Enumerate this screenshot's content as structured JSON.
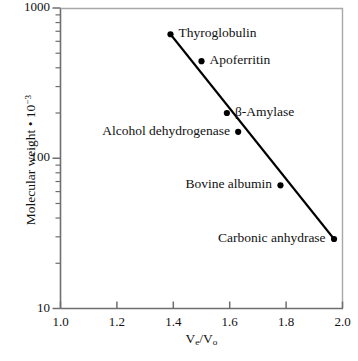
{
  "chart_data": {
    "type": "scatter",
    "title": "",
    "xlabel": "Ve/Vo",
    "ylabel": "Molecular weight • 10−3",
    "xlim": [
      1.0,
      2.0
    ],
    "ylim": [
      10,
      1000
    ],
    "yscale": "log",
    "xscale": "linear",
    "grid": false,
    "legend": "none",
    "xticks": [
      "1.0",
      "1.2",
      "1.4",
      "1.6",
      "1.8",
      "2.0"
    ],
    "xtick_values": [
      1.0,
      1.2,
      1.4,
      1.6,
      1.8,
      2.0
    ],
    "yticks": [
      "10",
      "100",
      "1000"
    ],
    "ytick_values": [
      10,
      100,
      1000
    ],
    "yminor_values": [
      20,
      30,
      40,
      50,
      60,
      70,
      80,
      90,
      200,
      300,
      400,
      500,
      600,
      700,
      800,
      900
    ],
    "series": [
      {
        "name": "proteins",
        "marker": "filled-circle",
        "points": [
          {
            "label": "Thyroglobulin",
            "x": 1.39,
            "y": 669,
            "label_pos": "right"
          },
          {
            "label": "Apoferritin",
            "x": 1.5,
            "y": 443,
            "label_pos": "right"
          },
          {
            "label": "β-Amylase",
            "x": 1.59,
            "y": 200,
            "label_pos": "right"
          },
          {
            "label": "Alcohol dehydrogenase",
            "x": 1.63,
            "y": 150,
            "label_pos": "left"
          },
          {
            "label": "Bovine albumin",
            "x": 1.78,
            "y": 66,
            "label_pos": "left"
          },
          {
            "label": "Carbonic anhydrase",
            "x": 1.97,
            "y": 29,
            "label_pos": "left"
          }
        ]
      }
    ],
    "fit_line": {
      "x1": 1.39,
      "y1": 669,
      "x2": 1.97,
      "y2": 29
    },
    "colors": {
      "axis": "#6e6e6e",
      "line": "#000000",
      "marker": "#000000",
      "text": "#111111"
    }
  },
  "axis": {
    "x_label_html": "V<sub>e</sub>/V<sub>o</sub>",
    "y_label_html": "Molecular weight • 10<sup>−3</sup>"
  }
}
